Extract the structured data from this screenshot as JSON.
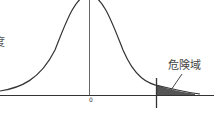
{
  "diagram": {
    "type": "normal-distribution-critical-region",
    "labels": {
      "origin": "0",
      "critical_region": "危険域",
      "left_axis_partial": "度"
    },
    "colors": {
      "curve": "#333333",
      "shade": "#555555",
      "axis": "#333333"
    }
  }
}
